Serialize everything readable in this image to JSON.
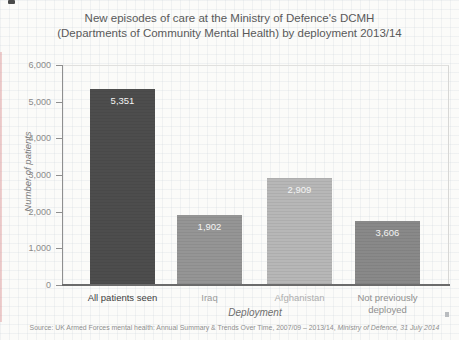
{
  "title": {
    "line1": "New episodes of care at the Ministry of Defence's DCMH",
    "line2": "(Departments of Community Mental Health) by deployment 2013/14"
  },
  "chart_data": {
    "type": "bar",
    "title": "New episodes of care at the Ministry of Defence's DCMH (Departments of Community Mental Health) by deployment 2013/14",
    "xlabel": "Deployment",
    "ylabel": "Number of patients",
    "ylim": [
      0,
      6000
    ],
    "grid": "faint graph-paper texture, no plot gridlines",
    "legend": "none",
    "ytick_labels": [
      "0",
      "1,000",
      "2,000",
      "3,000",
      "4,000",
      "5,000",
      "6,000"
    ],
    "categories": [
      "All patients seen",
      "Iraq",
      "Afghanistan",
      "Not previously deployed"
    ],
    "values": [
      5351,
      1902,
      2909,
      3606
    ],
    "bar_value_labels": [
      "5,351",
      "1,902",
      "2,909",
      "3,606"
    ],
    "drawn_bar_heights_in_units": [
      5351,
      1902,
      2909,
      1745
    ],
    "bar_colors": [
      "#4d4d4d",
      "#959595",
      "#b7b7b7",
      "#898989"
    ],
    "category_label_colors": [
      "#3f3f3f",
      "#9c9c9c",
      "#aeaeae",
      "#8f8f8f"
    ]
  },
  "source": {
    "regular": "Source: UK Armed Forces mental health: Annual Summary & Trends Over Time, 2007/09 – 2013/14, ",
    "italic": "Ministry of Defence, 31 July 2014"
  }
}
